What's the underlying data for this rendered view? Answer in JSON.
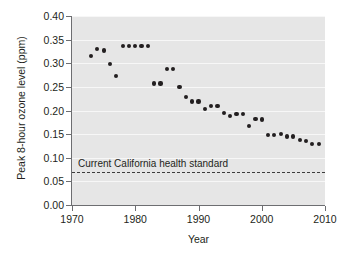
{
  "chart_data": {
    "type": "scatter",
    "title": "",
    "xlabel": "Year",
    "ylabel": "Peak 8-hour ozone level (ppm)",
    "xlim": [
      1970,
      2010
    ],
    "ylim": [
      0.0,
      0.4
    ],
    "xticks": [
      1970,
      1980,
      1990,
      2000,
      2010
    ],
    "yticks": [
      "0.00",
      "0.05",
      "0.10",
      "0.15",
      "0.20",
      "0.25",
      "0.30",
      "0.35",
      "0.40"
    ],
    "ytick_values": [
      0.0,
      0.05,
      0.1,
      0.15,
      0.2,
      0.25,
      0.3,
      0.35,
      0.4
    ],
    "grid": true,
    "grid_color": "#f7f7f7",
    "plot_background": "#e6e6e6",
    "marker_color": "#231f20",
    "legend": "none",
    "x": [
      1973,
      1974,
      1975,
      1976,
      1977,
      1978,
      1979,
      1980,
      1981,
      1982,
      1983,
      1984,
      1985,
      1986,
      1987,
      1988,
      1989,
      1990,
      1991,
      1992,
      1993,
      1994,
      1995,
      1996,
      1997,
      1998,
      1999,
      2000,
      2001,
      2002,
      2003,
      2004,
      2005,
      2006,
      2007,
      2008,
      2009
    ],
    "y": [
      0.315,
      0.33,
      0.327,
      0.299,
      0.273,
      0.336,
      0.336,
      0.337,
      0.337,
      0.337,
      0.257,
      0.257,
      0.288,
      0.288,
      0.25,
      0.229,
      0.219,
      0.219,
      0.204,
      0.209,
      0.209,
      0.195,
      0.188,
      0.192,
      0.192,
      0.168,
      0.182,
      0.181,
      0.148,
      0.148,
      0.151,
      0.145,
      0.145,
      0.138,
      0.136,
      0.129,
      0.129
    ],
    "annotations": [
      {
        "name": "california-health-standard",
        "label": "Current California health standard",
        "value": 0.07,
        "style": "dashed-horizontal-line",
        "color": "#3d3d3d"
      }
    ]
  }
}
